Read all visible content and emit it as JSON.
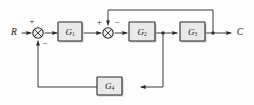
{
  "figure": {
    "type": "control-system-block-diagram",
    "background_color": "#fdfdfd",
    "line_color": "#3a3a3a",
    "block_fill_color": "#e9e9e9",
    "block_border_color": "#2b2b2b"
  },
  "io": {
    "input_label": "R",
    "output_label": "C"
  },
  "blocks": [
    {
      "id": "g1",
      "label": "G",
      "subscript": "1"
    },
    {
      "id": "g2",
      "label": "G",
      "subscript": "2"
    },
    {
      "id": "g3",
      "label": "G",
      "subscript": "3"
    },
    {
      "id": "g4",
      "label": "G",
      "subscript": "4"
    }
  ],
  "summing_junctions": [
    {
      "id": "sum1",
      "signs": {
        "input_left": "+",
        "feedback_bottom": "−"
      }
    },
    {
      "id": "sum2",
      "signs": {
        "input_left": "+",
        "feedback_top": "−"
      }
    }
  ],
  "signs": {
    "plus": "+",
    "minus": "−"
  }
}
